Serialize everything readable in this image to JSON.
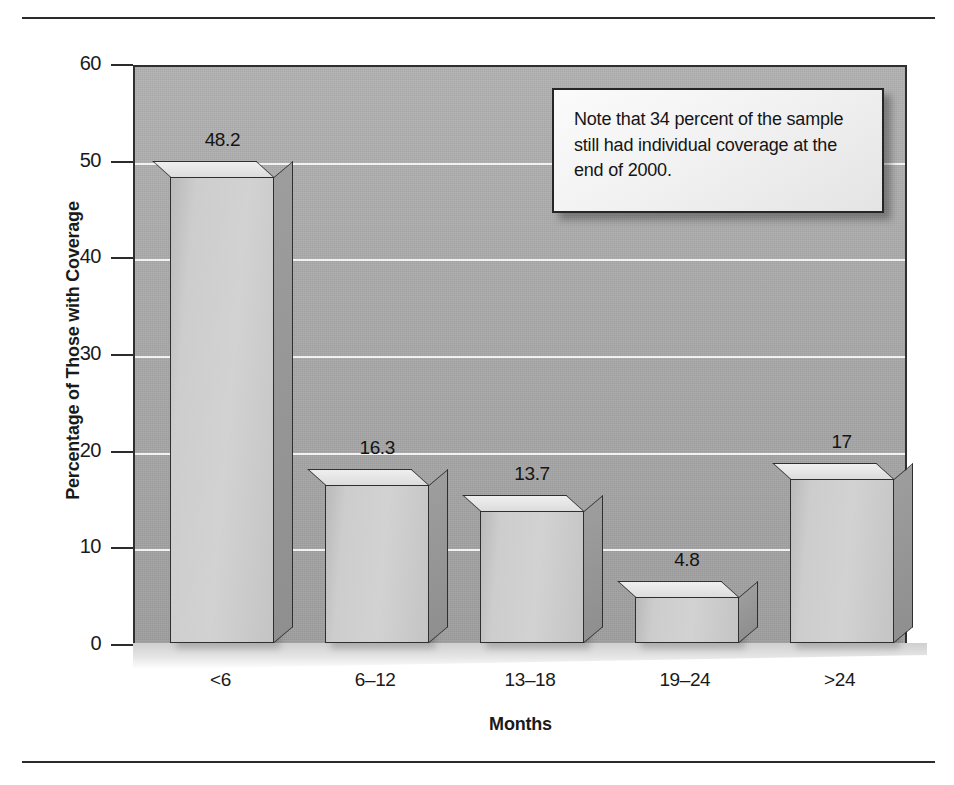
{
  "figure": {
    "note": {
      "text": "Note that 34 percent of the sample still had individual coverage at the end of 2000."
    }
  },
  "chart_data": {
    "type": "bar",
    "title": "",
    "subtitle": "",
    "xlabel": "Months",
    "ylabel": "Percentage of Those with Coverage",
    "categories": [
      "<6",
      "6–12",
      "13–18",
      "19–24",
      ">24"
    ],
    "values": [
      48.2,
      16.3,
      13.7,
      4.8,
      17
    ],
    "value_labels": [
      "48.2",
      "16.3",
      "13.7",
      "4.8",
      "17"
    ],
    "ylim": [
      0,
      60
    ],
    "yticks": [
      0,
      10,
      20,
      30,
      40,
      50,
      60
    ],
    "ytick_labels": [
      "0",
      "10",
      "20",
      "30",
      "40",
      "50",
      "60"
    ],
    "grid": true,
    "grid_axis": "y",
    "legend": false,
    "legend_position": "none",
    "style": "3d-bar",
    "colors": {
      "bar_face": "#cdcdcd",
      "bar_side": "#979797",
      "bar_top": "#e8e8e8",
      "bar_edge": "#2f2f2f",
      "plot_background": "#a9a9a9",
      "gridline": "#f2f2f2",
      "text": "#151515",
      "rule": "#2b2b2b",
      "note_background": "#f2f2f2"
    }
  }
}
